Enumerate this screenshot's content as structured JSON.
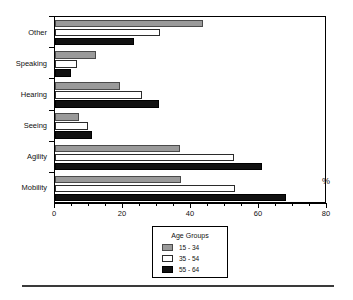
{
  "header": {
    "clipped_text": ""
  },
  "axis": {
    "x_tick_labels": [
      "0",
      "20",
      "40",
      "60",
      "80"
    ],
    "x_tick_values": [
      0,
      20,
      40,
      60,
      80
    ],
    "x_minor_step": 5,
    "percent_label": "%"
  },
  "legend": {
    "title": "Age Groups",
    "entries": [
      {
        "label": "15 - 34",
        "color": "#9a9a9a"
      },
      {
        "label": "35 - 54",
        "color": "#ffffff"
      },
      {
        "label": "55 - 64",
        "color": "#111111"
      }
    ]
  },
  "chart_data": {
    "type": "bar",
    "orientation": "horizontal",
    "title": "",
    "xlabel": "%",
    "ylabel": "",
    "xlim": [
      0,
      80
    ],
    "grid": false,
    "legend_position": "bottom-center",
    "legend_title": "Age Groups",
    "categories": [
      "Other",
      "Speaking",
      "Hearing",
      "Seeing",
      "Agility",
      "Mobility"
    ],
    "series": [
      {
        "name": "15 - 34",
        "color": "#9a9a9a",
        "values": [
          43.5,
          12.0,
          19.0,
          7.0,
          36.8,
          37.0
        ]
      },
      {
        "name": "35 - 54",
        "color": "#ffffff",
        "values": [
          31.0,
          6.5,
          25.5,
          9.7,
          52.6,
          53.0
        ]
      },
      {
        "name": "55 - 64",
        "color": "#111111",
        "values": [
          23.2,
          4.7,
          30.5,
          11.0,
          61.0,
          68.0
        ]
      }
    ]
  }
}
